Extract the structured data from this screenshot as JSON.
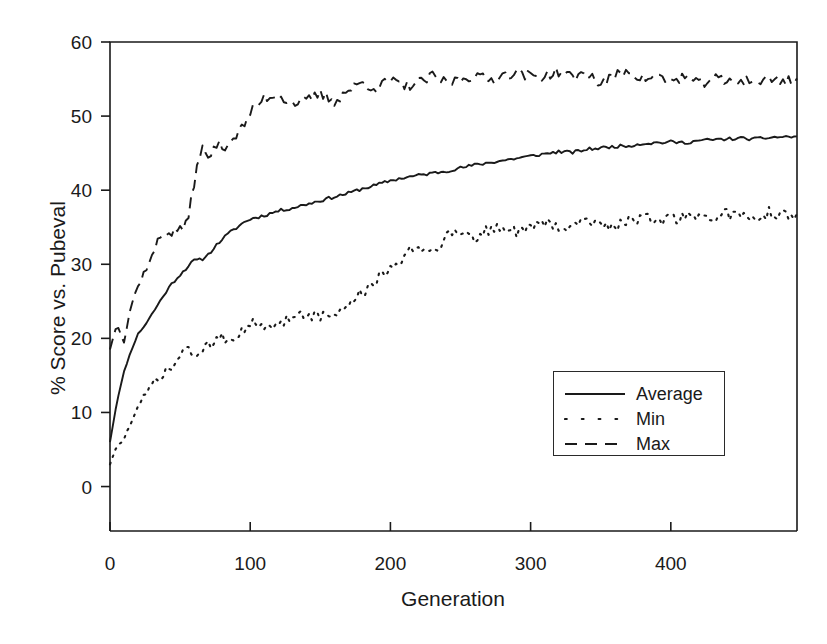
{
  "chart_data": {
    "type": "line",
    "title": "",
    "xlabel": "Generation",
    "ylabel": "% Score vs. Pubeval",
    "xlim": [
      0,
      490
    ],
    "ylim": [
      -6,
      60
    ],
    "xticks": [
      0,
      100,
      200,
      300,
      400
    ],
    "yticks": [
      0,
      10,
      20,
      30,
      40,
      50,
      60
    ],
    "xtick_labels": [
      "0",
      "100",
      "200",
      "300",
      "400"
    ],
    "ytick_labels": [
      "0",
      "10",
      "20",
      "30",
      "40",
      "50",
      "60"
    ],
    "grid": false,
    "legend_position": "center-right",
    "line_color": "#1a1a1a",
    "series": [
      {
        "name": "Average",
        "style": "solid",
        "x": [
          0,
          5,
          10,
          15,
          20,
          25,
          30,
          35,
          40,
          45,
          50,
          55,
          60,
          65,
          70,
          75,
          80,
          85,
          90,
          95,
          100,
          110,
          120,
          130,
          140,
          150,
          160,
          170,
          180,
          190,
          200,
          210,
          220,
          230,
          240,
          250,
          260,
          270,
          280,
          290,
          300,
          310,
          320,
          330,
          340,
          350,
          360,
          370,
          380,
          390,
          400,
          410,
          420,
          430,
          440,
          450,
          460,
          470,
          480,
          490
        ],
        "values": [
          6.0,
          11.5,
          15.5,
          18.3,
          20.6,
          21.8,
          23.3,
          24.8,
          26.3,
          27.6,
          28.6,
          29.6,
          30.5,
          30.6,
          31.3,
          32.4,
          33.4,
          34.2,
          34.9,
          35.6,
          36.1,
          36.6,
          37.2,
          37.6,
          38.1,
          38.6,
          39.1,
          39.6,
          40.2,
          40.7,
          41.3,
          41.7,
          42.0,
          42.3,
          42.6,
          43.0,
          43.4,
          43.7,
          44.0,
          44.3,
          44.6,
          44.9,
          45.2,
          45.1,
          45.5,
          45.7,
          45.9,
          46.0,
          46.3,
          46.4,
          46.5,
          46.4,
          46.7,
          46.8,
          46.9,
          47.0,
          46.9,
          47.1,
          47.2,
          47.2
        ]
      },
      {
        "name": "Min",
        "style": "dotted",
        "x": [
          0,
          5,
          10,
          15,
          20,
          25,
          30,
          35,
          40,
          45,
          50,
          55,
          60,
          65,
          70,
          75,
          80,
          85,
          90,
          95,
          100,
          110,
          120,
          130,
          140,
          150,
          160,
          170,
          180,
          190,
          200,
          210,
          220,
          230,
          240,
          250,
          260,
          270,
          280,
          290,
          300,
          310,
          320,
          330,
          340,
          350,
          360,
          370,
          380,
          390,
          400,
          410,
          420,
          430,
          440,
          450,
          460,
          470,
          480,
          490
        ],
        "values": [
          3.0,
          5.5,
          6.5,
          8.5,
          10.5,
          12.3,
          13.8,
          14.6,
          15.3,
          16.2,
          17.5,
          18.9,
          18.0,
          17.7,
          18.8,
          20.0,
          20.4,
          19.8,
          20.6,
          21.5,
          22.2,
          21.0,
          21.9,
          23.1,
          23.5,
          22.8,
          23.2,
          24.5,
          26.2,
          27.8,
          29.0,
          31.4,
          32.5,
          31.8,
          33.8,
          34.5,
          33.6,
          34.6,
          35.2,
          34.3,
          35.0,
          35.6,
          34.7,
          35.4,
          36.3,
          35.5,
          35.0,
          36.0,
          36.4,
          35.4,
          36.0,
          36.6,
          35.9,
          36.4,
          36.8,
          36.2,
          36.5,
          36.9,
          36.5,
          36.8
        ]
      },
      {
        "name": "Max",
        "style": "dashed",
        "x": [
          0,
          5,
          10,
          15,
          20,
          25,
          30,
          35,
          40,
          45,
          50,
          55,
          60,
          65,
          70,
          75,
          80,
          85,
          90,
          95,
          100,
          110,
          120,
          130,
          140,
          150,
          160,
          170,
          180,
          190,
          200,
          210,
          220,
          230,
          240,
          250,
          260,
          270,
          280,
          290,
          300,
          310,
          320,
          330,
          340,
          350,
          360,
          370,
          380,
          390,
          400,
          410,
          420,
          430,
          440,
          450,
          460,
          470,
          480,
          490
        ],
        "values": [
          18.5,
          22.0,
          19.5,
          24.5,
          27.0,
          29.2,
          31.0,
          33.5,
          34.5,
          34.2,
          35.0,
          35.2,
          41.0,
          46.0,
          44.0,
          46.2,
          45.8,
          46.5,
          47.5,
          48.5,
          50.5,
          52.5,
          52.8,
          51.8,
          52.0,
          53.0,
          52.0,
          53.5,
          54.5,
          53.8,
          54.8,
          54.0,
          54.5,
          55.3,
          54.5,
          55.0,
          55.5,
          54.8,
          55.5,
          56.0,
          55.3,
          55.5,
          56.0,
          55.2,
          55.8,
          54.3,
          55.4,
          56.2,
          55.0,
          55.4,
          54.7,
          55.4,
          54.2,
          55.2,
          54.5,
          55.0,
          54.6,
          55.0,
          54.8,
          54.9
        ]
      }
    ]
  },
  "legend": {
    "entries": [
      {
        "label": "Average",
        "style": "solid"
      },
      {
        "label": "Min",
        "style": "dotted"
      },
      {
        "label": "Max",
        "style": "dashed"
      }
    ]
  }
}
